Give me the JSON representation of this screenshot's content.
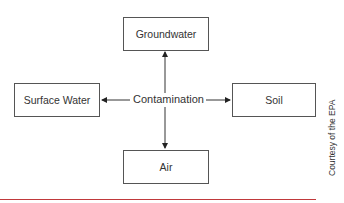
{
  "diagram": {
    "center": {
      "label": "Contamination"
    },
    "nodes": [
      {
        "id": "groundwater",
        "label": "Groundwater",
        "position": "top"
      },
      {
        "id": "surface-water",
        "label": "Surface Water",
        "position": "left"
      },
      {
        "id": "soil",
        "label": "Soil",
        "position": "right"
      },
      {
        "id": "air",
        "label": "Air",
        "position": "bottom"
      }
    ],
    "edges": [
      {
        "from": "contamination",
        "to": "groundwater",
        "arrow": "end"
      },
      {
        "from": "contamination",
        "to": "surface-water",
        "arrow": "end"
      },
      {
        "from": "contamination",
        "to": "soil",
        "arrow": "end"
      },
      {
        "from": "contamination",
        "to": "air",
        "arrow": "end"
      }
    ]
  },
  "credit": "Courtesy of the EPA",
  "colors": {
    "rule": "#c0393b",
    "line": "#333333",
    "box_border": "#555555"
  }
}
